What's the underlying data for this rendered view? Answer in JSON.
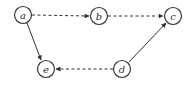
{
  "diagram": {
    "type": "directed-graph",
    "nodes": [
      {
        "id": "a",
        "label": "a",
        "x": 23,
        "y": 15
      },
      {
        "id": "b",
        "label": "b",
        "x": 99,
        "y": 16
      },
      {
        "id": "c",
        "label": "c",
        "x": 173,
        "y": 16
      },
      {
        "id": "d",
        "label": "d",
        "x": 122,
        "y": 69
      },
      {
        "id": "e",
        "label": "e",
        "x": 46,
        "y": 69
      }
    ],
    "edges": [
      {
        "from": "a",
        "to": "b",
        "style": "dashed"
      },
      {
        "from": "b",
        "to": "c",
        "style": "dashed"
      },
      {
        "from": "a",
        "to": "e",
        "style": "solid"
      },
      {
        "from": "d",
        "to": "c",
        "style": "solid"
      },
      {
        "from": "d",
        "to": "e",
        "style": "dashed"
      }
    ]
  }
}
